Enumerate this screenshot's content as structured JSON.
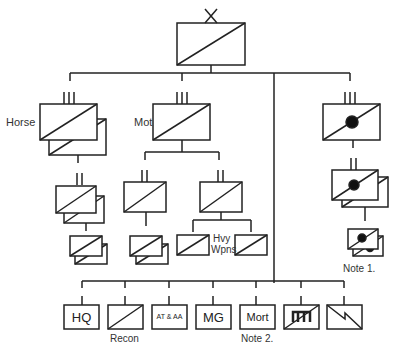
{
  "diagram": {
    "type": "military-organization-chart",
    "colors": {
      "line": "#222222",
      "text": "#333333",
      "background": "#ffffff"
    },
    "top_unit": {
      "echelon_mark": "X",
      "symbol": "infantry-cavalry-diagonal"
    },
    "branches": {
      "horse": {
        "label": "Horse",
        "echelon_mark": "III"
      },
      "mot": {
        "label": "Mot",
        "echelon_mark": "III"
      },
      "right": {
        "echelon_mark": "III",
        "symbol": "diagonal-with-dot"
      }
    },
    "labels": {
      "hvy_wpns_line1": "Hvy",
      "hvy_wpns_line2": "Wpns",
      "note1": "Note 1.",
      "recon": "Recon",
      "note2": "Note 2."
    },
    "support_units": [
      {
        "id": "hq",
        "text": "HQ"
      },
      {
        "id": "recon",
        "text": "",
        "symbol": "diagonal"
      },
      {
        "id": "at-aa",
        "text": "AT & AA"
      },
      {
        "id": "mg",
        "text": "MG"
      },
      {
        "id": "mort",
        "text": "Mort"
      },
      {
        "id": "engineer",
        "text": "",
        "symbol": "engineer-with-diagonal"
      },
      {
        "id": "signals",
        "text": "",
        "symbol": "signals-zigzag"
      }
    ]
  }
}
